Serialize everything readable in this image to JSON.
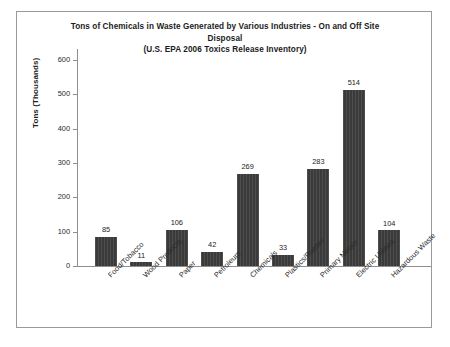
{
  "chart_data": {
    "type": "bar",
    "title": "Tons of Chemicals in Waste Generated by Various Industries - On and Off Site Disposal",
    "title_lines": [
      "Tons of Chemicals in Waste Generated by Various Industries - On and Off Site",
      "Disposal",
      "(U.S. EPA 2006 Toxics Release Inventory)"
    ],
    "subtitle": "(U.S. EPA 2006 Toxics Release Inventory)",
    "xlabel": "",
    "ylabel": "Tons (Thousands)",
    "ylim": [
      0,
      600
    ],
    "ytick_step": 100,
    "yticks": [
      600,
      500,
      400,
      300,
      200,
      100,
      0
    ],
    "ytick_labels": [
      "600",
      "500",
      "400",
      "300",
      "200",
      "100",
      "0"
    ],
    "grid": false,
    "legend": false,
    "bar_color": "#3a3a3a",
    "categories": [
      "Food/Tobacco",
      "Wood Products",
      "Paper",
      "Petroleum",
      "Chemicals",
      "Plastics/Rubber",
      "Primary Metals",
      "Electric Utilities",
      "Hazardous Waste"
    ],
    "values": [
      85,
      11,
      106,
      42,
      269,
      33,
      283,
      514,
      104
    ],
    "value_labels": [
      "85",
      "11",
      "106",
      "42",
      "269",
      "33",
      "283",
      "514",
      "104"
    ]
  }
}
